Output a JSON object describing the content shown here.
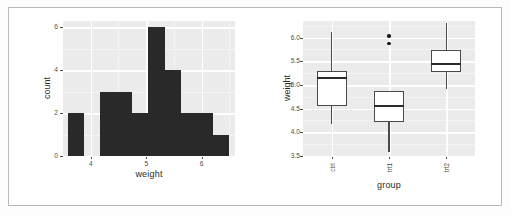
{
  "figure": {
    "panel_bg": "#ebebeb",
    "grid_color": "#ffffff",
    "bar_color": "#292929",
    "box_line_color": "#4a4a4a",
    "box_fill": "#ffffff",
    "frame_border": "#b9b9b9"
  },
  "chart_data": [
    {
      "type": "bar",
      "subtype": "histogram",
      "title": "",
      "xlabel": "weight",
      "ylabel": "count",
      "xlim": [
        3.5,
        6.6
      ],
      "ylim": [
        0,
        6.3
      ],
      "xticks": [
        "4",
        "5",
        "6"
      ],
      "xtick_values": [
        4,
        5,
        6
      ],
      "yticks": [
        "0",
        "2",
        "4",
        "6"
      ],
      "ytick_values": [
        0,
        2,
        4,
        6
      ],
      "grid": true,
      "legend": "none",
      "binwidth": 0.29,
      "bin_starts": [
        3.59,
        3.88,
        4.17,
        4.46,
        4.75,
        5.04,
        5.33,
        5.62,
        5.91,
        6.2
      ],
      "bin_ends": [
        3.88,
        4.17,
        4.46,
        4.75,
        5.04,
        5.33,
        5.62,
        5.91,
        6.2,
        6.49
      ],
      "categories": [
        "3.59-3.88",
        "3.88-4.17",
        "4.17-4.46",
        "4.46-4.75",
        "4.75-5.04",
        "5.04-5.33",
        "5.33-5.62",
        "5.62-5.91",
        "5.91-6.2",
        "6.2-6.49"
      ],
      "values": [
        2,
        0,
        3,
        3,
        2,
        6,
        4,
        2,
        2,
        1
      ]
    },
    {
      "type": "boxplot",
      "title": "",
      "xlabel": "group",
      "ylabel": "weight",
      "ylim": [
        3.5,
        6.35
      ],
      "yticks": [
        "3.5",
        "4.0",
        "4.5",
        "5.0",
        "5.5",
        "6.0"
      ],
      "ytick_values": [
        3.5,
        4.0,
        4.5,
        5.0,
        5.5,
        6.0
      ],
      "xticks": [
        "ctrl",
        "trt1",
        "trt2"
      ],
      "grid": true,
      "legend": "none",
      "boxes": [
        {
          "name": "ctrl",
          "whisker_low": 4.17,
          "q1": 4.55,
          "median": 5.155,
          "q3": 5.29,
          "whisker_high": 6.11,
          "outliers": []
        },
        {
          "name": "trt1",
          "whisker_low": 3.59,
          "q1": 4.21,
          "median": 4.55,
          "q3": 4.87,
          "whisker_high": 4.88,
          "outliers": [
            5.87,
            6.03
          ]
        },
        {
          "name": "trt2",
          "whisker_low": 4.92,
          "q1": 5.27,
          "median": 5.435,
          "q3": 5.735,
          "whisker_high": 6.31,
          "outliers": []
        }
      ]
    }
  ]
}
